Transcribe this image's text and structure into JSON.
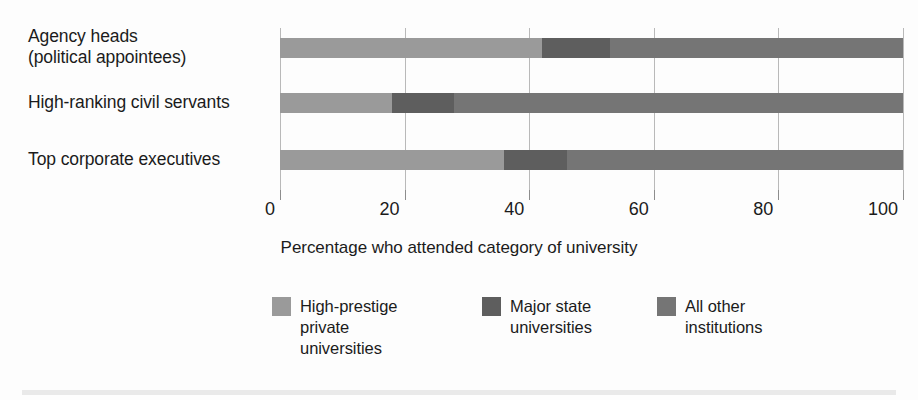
{
  "chart_data": {
    "type": "bar",
    "orientation": "horizontal",
    "stacked": true,
    "title": "",
    "xlabel": "Percentage who attended category of university",
    "ylabel": "",
    "xlim": [
      0,
      100
    ],
    "xticks": [
      0,
      20,
      40,
      60,
      80,
      100
    ],
    "xtick_labels": [
      "0",
      "20",
      "40",
      "60",
      "80",
      "100"
    ],
    "grid": true,
    "legend_position": "bottom",
    "categories": [
      "Agency heads\n(political appointees)",
      "High-ranking civil servants",
      "Top corporate executives"
    ],
    "series": [
      {
        "name": "High-prestige\nprivate\nuniversities",
        "color": "#9a9a9a",
        "values": [
          42,
          18,
          36
        ]
      },
      {
        "name": "Major state\nuniversities",
        "color": "#5e5e5e",
        "values": [
          11,
          10,
          10
        ]
      },
      {
        "name": "All other\ninstitutions",
        "color": "#757575",
        "values": [
          47,
          72,
          54
        ]
      }
    ]
  },
  "colors": {
    "high_prestige": "#9a9a9a",
    "major_state": "#5e5e5e",
    "all_other": "#757575",
    "gridline": "#b9b9b9",
    "axis": "#8d8d8d",
    "text": "#1b1b1b",
    "background": "#fdfdfd",
    "bottom_rule": "#e9e9e9"
  }
}
